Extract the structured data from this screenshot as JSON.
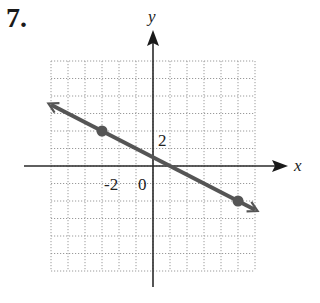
{
  "problem": {
    "number": "7."
  },
  "chart_data": {
    "type": "line",
    "title": "",
    "xlabel": "x",
    "ylabel": "y",
    "xlim": [
      -6,
      6
    ],
    "ylim": [
      -6,
      6
    ],
    "grid": true,
    "grid_step": 1,
    "tick_labels": {
      "x": [
        "-2"
      ],
      "y": [
        "2"
      ],
      "origin": "0"
    },
    "line": {
      "slope": -0.5,
      "intercept": 0.5,
      "arrows_both_ends": true,
      "from": [
        -6,
        3.5
      ],
      "to": [
        6,
        -2.5
      ]
    },
    "points": [
      {
        "x": -3,
        "y": 2
      },
      {
        "x": 5,
        "y": -2
      }
    ]
  },
  "colors": {
    "line": "#555555",
    "axes": "#2a2a2a",
    "grid": "#9a9a9a"
  }
}
